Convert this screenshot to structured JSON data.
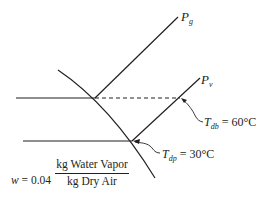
{
  "diagram": {
    "type": "psychrometric-process-sketch",
    "colors": {
      "line": "#231f20",
      "background": "#ffffff"
    },
    "lines": {
      "pg_line_label": "P",
      "pg_line_sub": "g",
      "pv_line_label": "P",
      "pv_line_sub": "v"
    },
    "annotations": {
      "tdb": {
        "symbol": "T",
        "sub": "db",
        "value": " = 60°C"
      },
      "tdp": {
        "symbol": "T",
        "sub": "dp",
        "value": " = 30°C"
      }
    },
    "humidity_ratio": {
      "symbol": "w",
      "equals": " = 0.04",
      "numerator": "kg Water Vapor",
      "denominator": "kg Dry Air"
    }
  }
}
